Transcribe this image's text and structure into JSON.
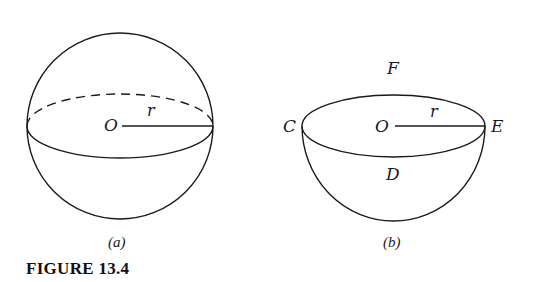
{
  "figure": {
    "caption": "FIGURE 13.4",
    "stroke_color": "#1a1a1a",
    "background": "#ffffff"
  },
  "panel_a": {
    "subcaption": "(a)",
    "shape": "sphere",
    "center_label": "O",
    "radius_label": "r"
  },
  "panel_b": {
    "subcaption": "(b)",
    "shape": "hemisphere",
    "center_label": "O",
    "radius_label": "r",
    "left_label": "C",
    "right_label": "E",
    "top_label": "F",
    "bottom_label": "D"
  }
}
